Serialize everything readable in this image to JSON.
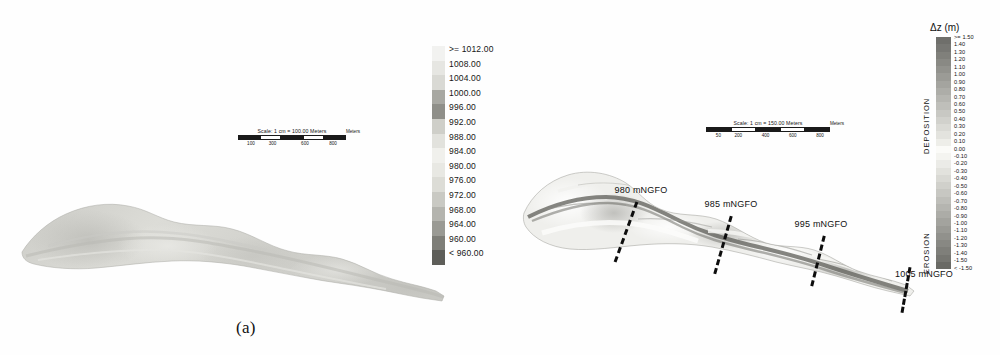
{
  "figure": {
    "panels": [
      {
        "id": "a",
        "caption": "(a)",
        "scalebar": {
          "title": "Scale: 1 cm = 100.00 Meters",
          "unit": "Meters",
          "ticks": [
            "100",
            "300",
            "600",
            "800"
          ]
        },
        "legend": {
          "title": "",
          "entries": [
            ">= 1012.00",
            "1008.00",
            "1004.00",
            "1000.00",
            "996.00",
            "992.00",
            "988.00",
            "984.00",
            "980.00",
            "976.00",
            "972.00",
            "968.00",
            "964.00",
            "960.00",
            "< 960.00"
          ],
          "colors": [
            "#f2f2f0",
            "#e6e6e2",
            "#d9d9d4",
            "#a8a8a2",
            "#8f8f89",
            "#cfcfc9",
            "#e2e2dd",
            "#f0f0ec",
            "#e8e8e3",
            "#dcdcd6",
            "#c9c9c3",
            "#b4b4ae",
            "#9a9a94",
            "#7e7e78",
            "#5e5e59"
          ]
        }
      },
      {
        "id": "b",
        "caption": "(b)",
        "scalebar": {
          "title": "Scale: 1 cm = 150.00 Meters",
          "unit": "Meters",
          "ticks": [
            "50",
            "200",
            "400",
            "600",
            "800"
          ]
        },
        "legend": {
          "title": "Δz (m)",
          "deposition_label": "DEPOSITION",
          "erosion_label": "EROSION",
          "entries": [
            ">= 1.50",
            "1.40",
            "1.30",
            "1.20",
            "1.10",
            "1.00",
            "0.90",
            "0.80",
            "0.70",
            "0.60",
            "0.50",
            "0.40",
            "0.30",
            "0.20",
            "0.10",
            "0.00",
            "-0.10",
            "-0.20",
            "-0.30",
            "-0.40",
            "-0.50",
            "-0.60",
            "-0.70",
            "-0.80",
            "-0.90",
            "-1.00",
            "-1.10",
            "-1.20",
            "-1.30",
            "-1.40",
            "-1.50",
            "< -1.50"
          ],
          "colors": [
            "#6f6f6b",
            "#777773",
            "#80807b",
            "#898984",
            "#92928d",
            "#9b9b96",
            "#a4a49f",
            "#adada8",
            "#b6b6b1",
            "#bfbfba",
            "#c8c8c3",
            "#d1d1cc",
            "#dadad5",
            "#e3e3de",
            "#eeeee9",
            "#fbfbf8",
            "#f4f4f0",
            "#ebebe7",
            "#e2e2dd",
            "#d9d9d4",
            "#d0d0cb",
            "#c7c7c2",
            "#bebeb9",
            "#b5b5b0",
            "#acaca7",
            "#a3a39e",
            "#9a9a95",
            "#91918c",
            "#888883",
            "#7f7f7a",
            "#767671",
            "#6a6a65"
          ]
        },
        "cross_sections": [
          {
            "label": "980 mNGFO",
            "x": 123,
            "y": 40,
            "line_x": 108,
            "line_y": 45,
            "line_h": 64,
            "tilt": 20
          },
          {
            "label": "985 mNGFO",
            "x": 213,
            "y": 54,
            "line_x": 205,
            "line_y": 60,
            "line_h": 60,
            "tilt": 16
          },
          {
            "label": "995 mNGFO",
            "x": 303,
            "y": 74,
            "line_x": 300,
            "line_y": 80,
            "line_h": 52,
            "tilt": 14
          },
          {
            "label": "1005 mNGFO",
            "x": 406,
            "y": 124,
            "line_x": 388,
            "line_y": 112,
            "line_h": 46,
            "tilt": 10
          }
        ]
      }
    ]
  }
}
